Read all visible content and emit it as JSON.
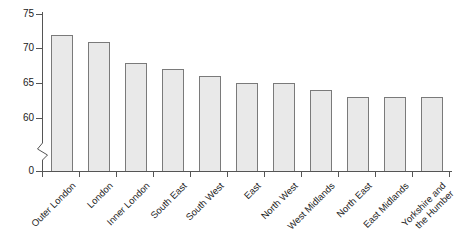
{
  "chart_data": {
    "type": "bar",
    "title": "",
    "subtitle": "",
    "xlabel": "",
    "ylabel": "",
    "ylim": [
      0,
      75
    ],
    "y_ticks": [
      0,
      60,
      65,
      70,
      75
    ],
    "y_axis_break": true,
    "y_axis_break_between": [
      0,
      60
    ],
    "grid": false,
    "legend": false,
    "categories": [
      "Outer London",
      "London",
      "Inner London",
      "South East",
      "South West",
      "East",
      "North West",
      "West Midlands",
      "North East",
      "East Midlands",
      "Yorkshire and\nthe Humber"
    ],
    "values": [
      72,
      71,
      68,
      67,
      66,
      65,
      65,
      64,
      63,
      63,
      63
    ],
    "bar_fill_color": "#e9e9e9",
    "bar_border_color": "#7a7a7a",
    "axis_color": "#555555",
    "text_color": "#1f1f1f"
  }
}
